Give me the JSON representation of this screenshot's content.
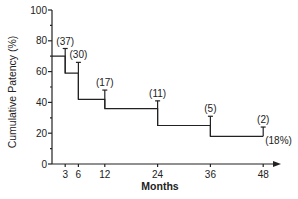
{
  "chart_data": {
    "type": "line",
    "subtype": "kaplan-meier step",
    "title": "",
    "xlabel": "Months",
    "ylabel": "Cumulative Patency (%)",
    "xlim": [
      0,
      50
    ],
    "ylim": [
      0,
      100
    ],
    "x_ticks": [
      3,
      6,
      12,
      24,
      36,
      48
    ],
    "y_ticks": [
      0,
      20,
      40,
      60,
      80,
      100
    ],
    "grid": false,
    "legend": null,
    "series": [
      {
        "name": "Cumulative Patency",
        "steps": [
          {
            "x_start": 0,
            "x_end": 3,
            "y": 70
          },
          {
            "x_start": 3,
            "x_end": 6,
            "y": 59
          },
          {
            "x_start": 6,
            "x_end": 12,
            "y": 42
          },
          {
            "x_start": 12,
            "x_end": 24,
            "y": 36
          },
          {
            "x_start": 24,
            "x_end": 36,
            "y": 25
          },
          {
            "x_start": 36,
            "x_end": 48,
            "y": 18
          }
        ]
      }
    ],
    "annotations": [
      {
        "x": 3,
        "label": "(37)",
        "error_bar_top": 75
      },
      {
        "x": 6,
        "label": "(30)",
        "error_bar_top": 66
      },
      {
        "x": 12,
        "label": "(17)",
        "error_bar_top": 48
      },
      {
        "x": 24,
        "label": "(11)",
        "error_bar_top": 41
      },
      {
        "x": 36,
        "label": "(5)",
        "error_bar_top": 31
      },
      {
        "x": 48,
        "label": "(2)",
        "error_bar_top": 24
      },
      {
        "x": 48,
        "label": "(18%)",
        "note": "final cumulative patency"
      }
    ]
  }
}
